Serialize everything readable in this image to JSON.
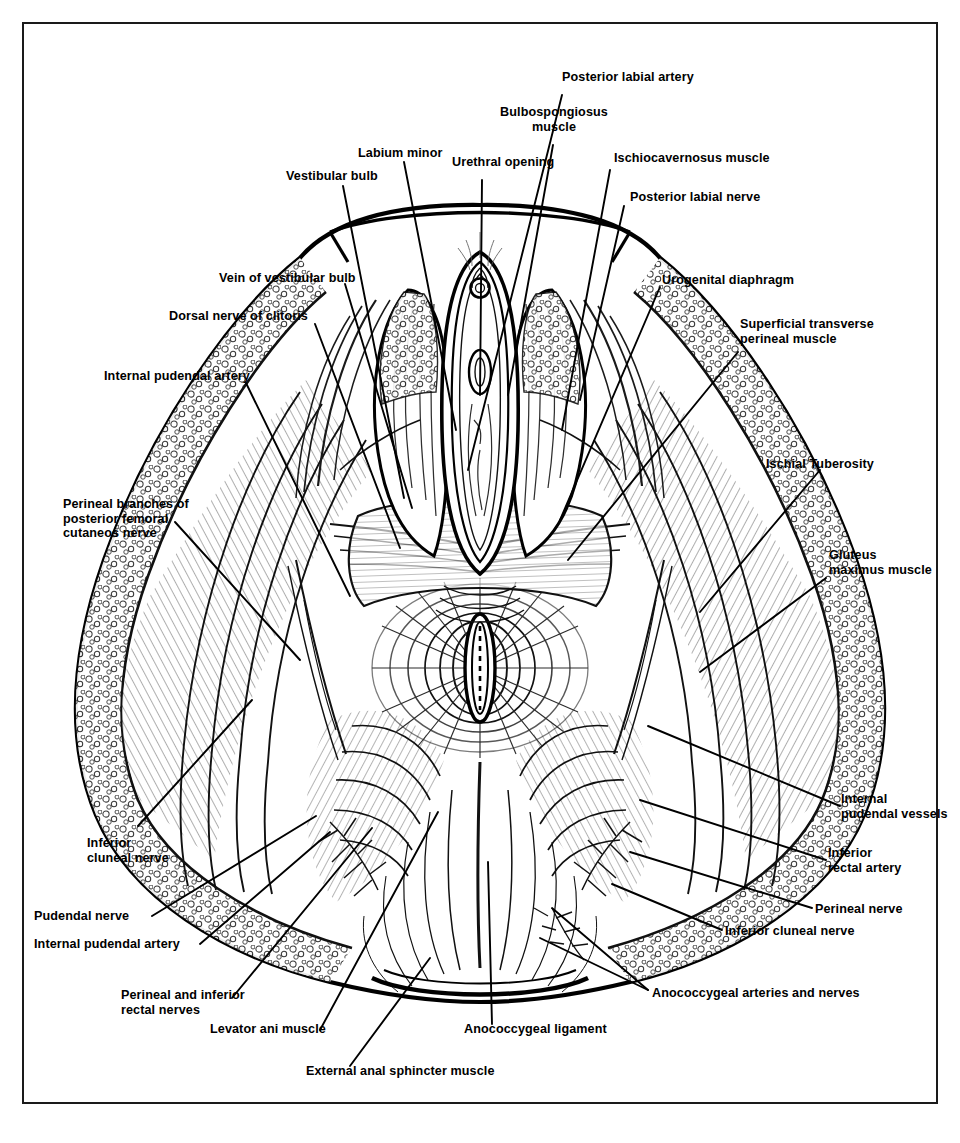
{
  "figure": {
    "frame_color": "#1a1a1a",
    "ink_color": "#000000",
    "background": "#ffffff"
  },
  "labels": {
    "posterior_labial_artery": "Posterior labial artery",
    "bulbospongiosus_muscle": "Bulbospongiosus\nmuscle",
    "labium_minor": "Labium minor",
    "urethral_opening": "Urethral opening",
    "ischiocavernosus_muscle": "Ischiocavernosus muscle",
    "posterior_labial_nerve": "Posterior labial nerve",
    "vestibular_bulb": "Vestibular bulb",
    "vein_of_vestibular_bulb": "Vein of vestibular bulb",
    "dorsal_nerve_of_clitoris": "Dorsal nerve of clitoris",
    "internal_pudendal_artery_top": "Internal pudendal artery",
    "urogenital_diaphragm": "Urogenital diaphragm",
    "superficial_transverse_perineal_muscle": "Superficial transverse\nperineal muscle",
    "perineal_branches": "Perineal branches of\nposterior femoral\ncutaneos nerve",
    "ischial_tuberosity": "Ischial Tuberosity",
    "gluteus_maximus_muscle": "Gluteus\nmaximus muscle",
    "internal_pudendal_vessels": "Internal\npudendal vessels",
    "inferior_rectal_artery": "Inferior\nrectal artery",
    "perineal_nerve": "Perineal nerve",
    "inferior_cluneal_nerve_left": "Inferior\ncluneal nerve",
    "pudendal_nerve": "Pudendal nerve",
    "internal_pudendal_artery_bottom": "Internal pudendal artery",
    "perineal_and_inferior_rectal_nerves": "Perineal and inferior\nrectal nerves",
    "levator_ani_muscle": "Levator ani muscle",
    "external_anal_sphincter_muscle": "External anal sphincter muscle",
    "anococcygeal_ligament": "Anococcygeal ligament",
    "anococcygeal_arteries_and_nerves": "Anococcygeal arteries and nerves",
    "inferior_cluneal_nerve_right": "Inferior cluneal nerve"
  },
  "label_list": [
    "Posterior labial artery",
    "Bulbospongiosus muscle",
    "Labium minor",
    "Urethral opening",
    "Ischiocavernosus muscle",
    "Posterior labial nerve",
    "Vestibular bulb",
    "Vein of vestibular bulb",
    "Dorsal nerve of clitoris",
    "Internal pudendal artery",
    "Urogenital diaphragm",
    "Superficial transverse perineal muscle",
    "Perineal branches of posterior femoral cutaneos nerve",
    "Ischial Tuberosity",
    "Gluteus maximus muscle",
    "Internal pudendal vessels",
    "Inferior rectal artery",
    "Perineal nerve",
    "Inferior cluneal nerve",
    "Pudendal nerve",
    "Internal pudendal artery",
    "Perineal and inferior rectal nerves",
    "Levator ani muscle",
    "External anal sphincter muscle",
    "Anococcygeal ligament",
    "Anococcygeal arteries and nerves",
    "Inferior cluneal nerve"
  ],
  "artifact": {
    "bottom_ghost_text": "                                                                                                "
  }
}
